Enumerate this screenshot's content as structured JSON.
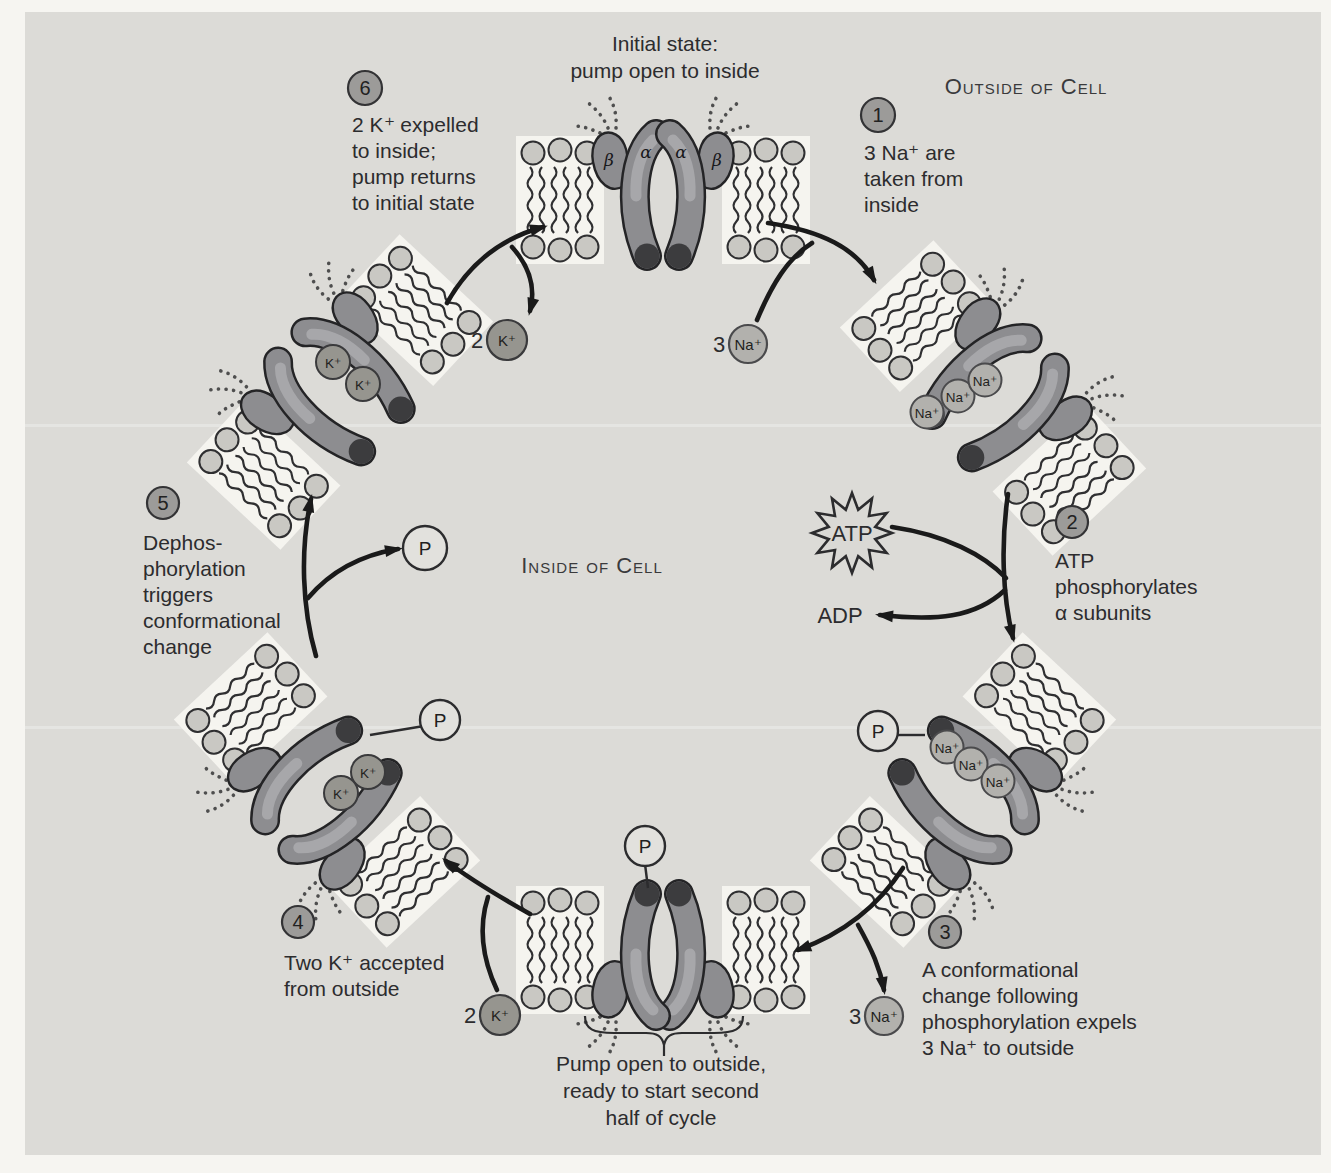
{
  "figure": {
    "title": "Initial state:\npump open to inside",
    "outside_label": "Outside of Cell",
    "inside_label": "Inside of Cell",
    "bottom_caption": "Pump open to outside,\nready to start second\nhalf of cycle"
  },
  "steps": [
    {
      "number": "1",
      "text": "3 Na⁺ are\ntaken from\ninside"
    },
    {
      "number": "2",
      "text": "ATP\nphosphorylates\nα subunits"
    },
    {
      "number": "3",
      "text": "A conformational\nchange following\nphosphorylation expels\n3 Na⁺ to outside"
    },
    {
      "number": "4",
      "text": "Two K⁺ accepted\nfrom outside"
    },
    {
      "number": "5",
      "text": "Dephos-\nphorylation\ntriggers\nconformational\nchange"
    },
    {
      "number": "6",
      "text": "2 K⁺ expelled\nto inside;\npump returns\nto initial state"
    }
  ],
  "ions": {
    "sodium_symbol": "Na⁺",
    "potassium_symbol": "K⁺",
    "sodium_count": "3",
    "potassium_count": "2"
  },
  "molecules": {
    "atp": "ATP",
    "adp": "ADP",
    "phosphate": "P"
  },
  "subunits": {
    "alpha": "α",
    "beta": "β"
  },
  "colors": {
    "page_bg": "#f6f5f1",
    "panel_bg": "#dcdbd7",
    "protein": "#8d8d90",
    "protein_dark_tip": "#3c3c3e",
    "lipid_head": "#c9c8c3",
    "sodium_fill": "#b2b1ad",
    "potassium_fill": "#96958f",
    "step_circle_fill": "#9c9b99",
    "arrow": "#1a1a1a"
  }
}
